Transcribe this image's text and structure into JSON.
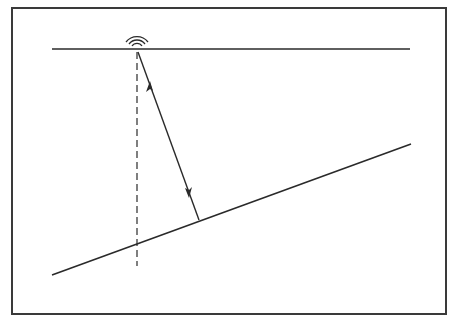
{
  "diagram": {
    "type": "sonar-slant-range",
    "colors": {
      "stroke": "#2a2a2a",
      "frame": "#3a3a3a",
      "background": "#ffffff"
    },
    "frame": {
      "x": 12,
      "y": 8,
      "width": 434,
      "height": 306
    },
    "surface_line": {
      "x1": 52,
      "y1": 49,
      "x2": 410,
      "y2": 49
    },
    "emitter": {
      "x": 137,
      "y": 50,
      "arcs": 3,
      "icon": "signal-waves-icon"
    },
    "bottom_line": {
      "x1": 52,
      "y1": 275,
      "x2": 411,
      "y2": 144
    },
    "slant_range_arrow": {
      "x1": 137,
      "y1": 50,
      "x2": 199,
      "y2": 220,
      "heads": "both"
    },
    "vertical_dashed": {
      "x1": 137,
      "y1": 52,
      "x2": 137,
      "y2": 266
    }
  }
}
